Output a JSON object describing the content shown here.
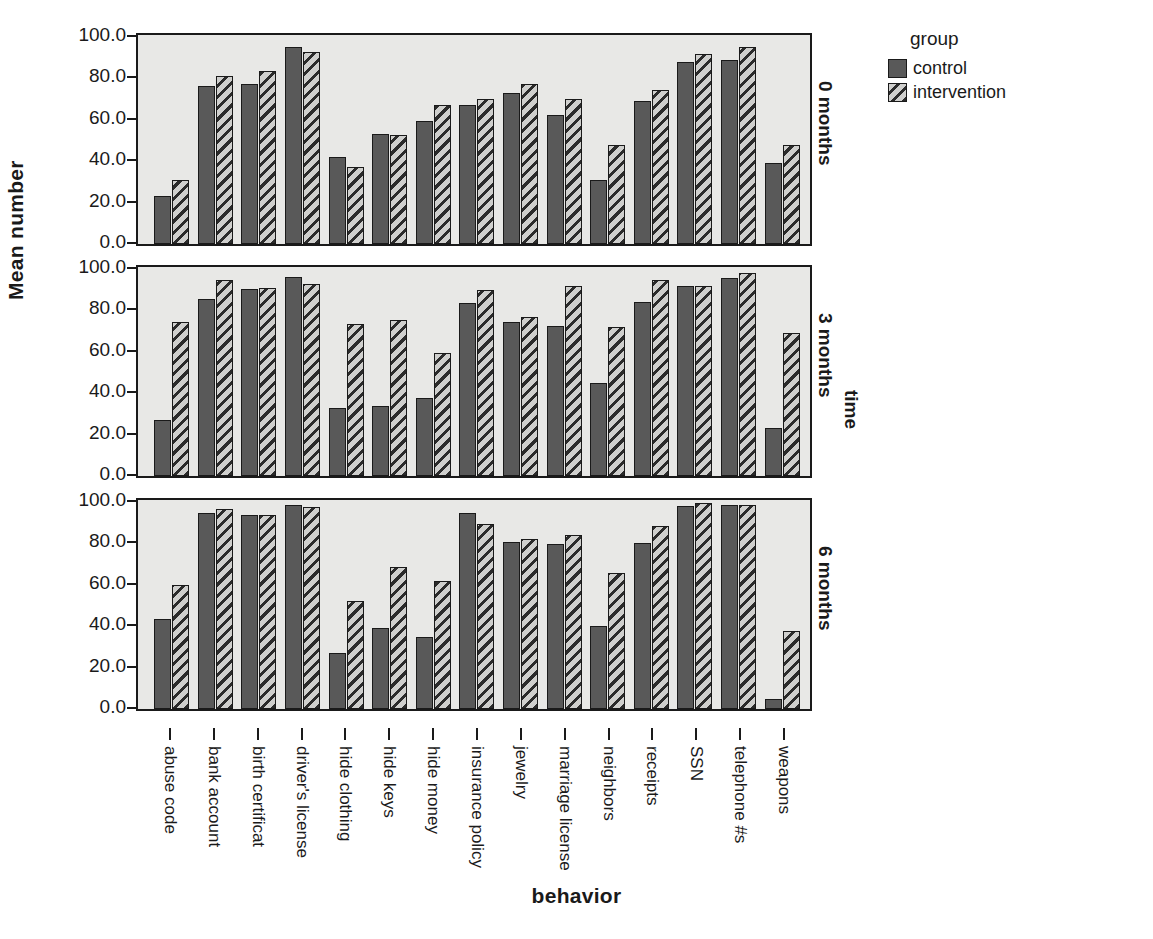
{
  "chart_data": {
    "type": "bar",
    "title": "",
    "xlabel": "behavior",
    "ylabel": "Mean number",
    "ylim": [
      0,
      100
    ],
    "yticks": [
      "0.0",
      "20.0",
      "40.0",
      "60.0",
      "80.0",
      "100.0"
    ],
    "grid": false,
    "legend": {
      "title": "group",
      "position": "right",
      "entries": [
        {
          "name": "control",
          "pattern": "solid-dark-gray"
        },
        {
          "name": "intervention",
          "pattern": "diagonal-hatch"
        }
      ]
    },
    "facet_variable": "time",
    "facets": [
      "0 months",
      "3 months",
      "6 months"
    ],
    "categories": [
      "abuse code",
      "bank account",
      "birth certificat",
      "driver's license",
      "hide clothing",
      "hide keys",
      "hide money",
      "insurance policy",
      "jewelry",
      "marriage license",
      "neighbors",
      "receipts",
      "SSN",
      "telephone #s",
      "weapons"
    ],
    "panels": [
      {
        "facet": "0 months",
        "series": [
          {
            "name": "control",
            "values": [
              23.0,
              76.5,
              77.5,
              95.0,
              42.0,
              53.0,
              59.5,
              67.0,
              73.0,
              62.5,
              31.0,
              69.0,
              88.0,
              89.0,
              39.0
            ]
          },
          {
            "name": "intervention",
            "values": [
              31.0,
              81.0,
              83.5,
              93.0,
              37.0,
              52.5,
              67.0,
              70.0,
              77.5,
              70.0,
              48.0,
              74.5,
              92.0,
              95.0,
              48.0
            ]
          }
        ]
      },
      {
        "facet": "3 months",
        "series": [
          {
            "name": "control",
            "values": [
              27.0,
              85.5,
              90.5,
              96.0,
              33.0,
              34.0,
              37.5,
              83.5,
              74.5,
              72.5,
              45.0,
              84.0,
              92.0,
              95.5,
              23.0
            ]
          },
          {
            "name": "intervention",
            "values": [
              74.5,
              94.5,
              91.0,
              93.0,
              73.5,
              75.5,
              59.5,
              90.0,
              77.0,
              92.0,
              72.0,
              94.5,
              92.0,
              98.0,
              69.0
            ]
          }
        ]
      },
      {
        "facet": "6 months",
        "series": [
          {
            "name": "control",
            "values": [
              43.5,
              94.5,
              93.5,
              98.5,
              27.0,
              39.0,
              35.0,
              94.5,
              80.5,
              79.5,
              40.0,
              80.0,
              98.0,
              98.5,
              5.0
            ]
          },
          {
            "name": "intervention",
            "values": [
              60.0,
              96.5,
              93.5,
              97.5,
              52.0,
              68.5,
              62.0,
              89.5,
              82.0,
              84.0,
              65.5,
              88.5,
              99.5,
              98.5,
              37.5
            ]
          }
        ]
      }
    ],
    "colors": {
      "control": "#595959",
      "intervention_fill": "#cfcfcd",
      "intervention_hatch": "#2b2b2b",
      "panel_background": "#e8e8e6",
      "axis": "#1a1a1a"
    }
  }
}
